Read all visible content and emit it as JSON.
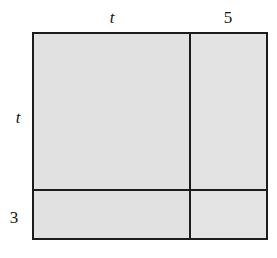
{
  "figure": {
    "kind": "area-model-diagram",
    "colors": {
      "fill": "#e2e2e2",
      "stroke": "#1c1c1c",
      "background": "#ffffff",
      "text": "#141414"
    }
  },
  "labels": {
    "top_left": "t",
    "top_right": "5",
    "left_upper": "t",
    "left_lower": "3"
  },
  "dimensions": {
    "total_width_expression": "t + 5",
    "total_height_expression": "t + 3",
    "segments": {
      "top": [
        "t",
        "5"
      ],
      "left": [
        "t",
        "3"
      ]
    }
  }
}
